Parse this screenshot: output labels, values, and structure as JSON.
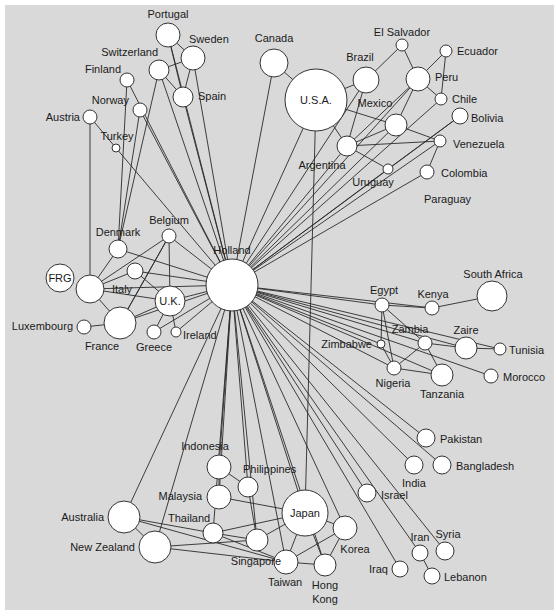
{
  "diagram": {
    "type": "network",
    "background": "#d9d9d9",
    "node_fill": "#ffffff",
    "edge_color": "#2a2a2a",
    "nodes": [
      {
        "id": "holland",
        "label": "Holland",
        "x": 232,
        "y": 285,
        "r": 26,
        "lx": 232,
        "ly": 254,
        "anchor": "middle"
      },
      {
        "id": "usa",
        "label": "U.S.A.",
        "x": 316,
        "y": 100,
        "r": 31,
        "lx": 316,
        "ly": 104,
        "anchor": "middle"
      },
      {
        "id": "canada",
        "label": "Canada",
        "x": 274,
        "y": 63,
        "r": 14,
        "lx": 274,
        "ly": 42,
        "anchor": "middle"
      },
      {
        "id": "brazil",
        "label": "Brazil",
        "x": 366,
        "y": 80,
        "r": 13,
        "lx": 360,
        "ly": 61,
        "anchor": "middle"
      },
      {
        "id": "elsalvador",
        "label": "El Salvador",
        "x": 402,
        "y": 45,
        "r": 6,
        "lx": 402,
        "ly": 36,
        "anchor": "middle"
      },
      {
        "id": "ecuador",
        "label": "Ecuador",
        "x": 446,
        "y": 51,
        "r": 6,
        "lx": 457,
        "ly": 55,
        "anchor": "start"
      },
      {
        "id": "peru",
        "label": "Peru",
        "x": 418,
        "y": 79,
        "r": 12,
        "lx": 435,
        "ly": 81,
        "anchor": "start"
      },
      {
        "id": "chile",
        "label": "Chile",
        "x": 441,
        "y": 99,
        "r": 6,
        "lx": 452,
        "ly": 103,
        "anchor": "start"
      },
      {
        "id": "mexico",
        "label": "Mexico",
        "x": 396,
        "y": 125,
        "r": 11,
        "lx": 375,
        "ly": 107,
        "anchor": "middle"
      },
      {
        "id": "bolivia",
        "label": "Bolivia",
        "x": 460,
        "y": 116,
        "r": 8,
        "lx": 471,
        "ly": 122,
        "anchor": "start"
      },
      {
        "id": "venezuela",
        "label": "Venezuela",
        "x": 440,
        "y": 141,
        "r": 6,
        "lx": 453,
        "ly": 148,
        "anchor": "start"
      },
      {
        "id": "argentina",
        "label": "Argentina",
        "x": 347,
        "y": 146,
        "r": 10,
        "lx": 322,
        "ly": 169,
        "anchor": "middle"
      },
      {
        "id": "uruguay",
        "label": "Uruguay",
        "x": 388,
        "y": 169,
        "r": 5,
        "lx": 373,
        "ly": 186,
        "anchor": "middle"
      },
      {
        "id": "colombia",
        "label": "Colombia",
        "x": 427,
        "y": 172,
        "r": 7,
        "lx": 441,
        "ly": 177,
        "anchor": "start"
      },
      {
        "id": "paraguay",
        "label": "Paraguay",
        "x": 0,
        "y": 0,
        "r": 0,
        "lx": 424,
        "ly": 203,
        "anchor": "start"
      },
      {
        "id": "portugal",
        "label": "Portugal",
        "x": 168,
        "y": 35,
        "r": 12,
        "lx": 168,
        "ly": 18,
        "anchor": "middle"
      },
      {
        "id": "sweden",
        "label": "Sweden",
        "x": 193,
        "y": 58,
        "r": 12,
        "lx": 189,
        "ly": 43,
        "anchor": "start"
      },
      {
        "id": "switzerland",
        "label": "Switzerland",
        "x": 159,
        "y": 70,
        "r": 10,
        "lx": 158,
        "ly": 56,
        "anchor": "end"
      },
      {
        "id": "spain",
        "label": "Spain",
        "x": 183,
        "y": 97,
        "r": 10,
        "lx": 198,
        "ly": 100,
        "anchor": "start"
      },
      {
        "id": "finland",
        "label": "Finland",
        "x": 127,
        "y": 80,
        "r": 7,
        "lx": 121,
        "ly": 73,
        "anchor": "end"
      },
      {
        "id": "norway",
        "label": "Norway",
        "x": 140,
        "y": 110,
        "r": 7,
        "lx": 129,
        "ly": 104,
        "anchor": "end"
      },
      {
        "id": "austria",
        "label": "Austria",
        "x": 90,
        "y": 117,
        "r": 7,
        "lx": 80,
        "ly": 121,
        "anchor": "end"
      },
      {
        "id": "turkey",
        "label": "Turkey",
        "x": 116,
        "y": 148,
        "r": 4,
        "lx": 117,
        "ly": 140,
        "anchor": "middle"
      },
      {
        "id": "belgium",
        "label": "Belgium",
        "x": 169,
        "y": 236,
        "r": 7,
        "lx": 169,
        "ly": 224,
        "anchor": "middle"
      },
      {
        "id": "denmark",
        "label": "Denmark",
        "x": 118,
        "y": 249,
        "r": 9,
        "lx": 118,
        "ly": 236,
        "anchor": "middle"
      },
      {
        "id": "frg",
        "label": "FRG",
        "x": 60,
        "y": 278,
        "r": 14,
        "lx": 60,
        "ly": 282,
        "anchor": "middle"
      },
      {
        "id": "germany",
        "label": "",
        "x": 90,
        "y": 289,
        "r": 14,
        "lx": 0,
        "ly": 0,
        "anchor": "middle"
      },
      {
        "id": "italy",
        "label": "Italy",
        "x": 135,
        "y": 271,
        "r": 8,
        "lx": 122,
        "ly": 293,
        "anchor": "middle"
      },
      {
        "id": "uk",
        "label": "U.K.",
        "x": 170,
        "y": 301,
        "r": 15,
        "lx": 170,
        "ly": 305,
        "anchor": "middle"
      },
      {
        "id": "france",
        "label": "France",
        "x": 120,
        "y": 323,
        "r": 16,
        "lx": 102,
        "ly": 350,
        "anchor": "middle"
      },
      {
        "id": "luxembourg",
        "label": "Luxembourg",
        "x": 84,
        "y": 327,
        "r": 7,
        "lx": 73,
        "ly": 330,
        "anchor": "end"
      },
      {
        "id": "greece",
        "label": "Greece",
        "x": 154,
        "y": 332,
        "r": 7,
        "lx": 154,
        "ly": 351,
        "anchor": "middle"
      },
      {
        "id": "ireland",
        "label": "Ireland",
        "x": 176,
        "y": 332,
        "r": 5,
        "lx": 183,
        "ly": 339,
        "anchor": "start"
      },
      {
        "id": "egypt",
        "label": "Egypt",
        "x": 382,
        "y": 305,
        "r": 7,
        "lx": 384,
        "ly": 294,
        "anchor": "middle"
      },
      {
        "id": "kenya",
        "label": "Kenya",
        "x": 432,
        "y": 308,
        "r": 7,
        "lx": 433,
        "ly": 298,
        "anchor": "middle"
      },
      {
        "id": "southafrica",
        "label": "South Africa",
        "x": 492,
        "y": 296,
        "r": 15,
        "lx": 493,
        "ly": 278,
        "anchor": "middle"
      },
      {
        "id": "zimbabwe",
        "label": "Zimbabwe",
        "x": 381,
        "y": 344,
        "r": 4,
        "lx": 372,
        "ly": 348,
        "anchor": "end"
      },
      {
        "id": "zambia",
        "label": "Zambia",
        "x": 425,
        "y": 343,
        "r": 7,
        "lx": 410,
        "ly": 333,
        "anchor": "middle"
      },
      {
        "id": "zaire",
        "label": "Zaire",
        "x": 466,
        "y": 348,
        "r": 11,
        "lx": 466,
        "ly": 334,
        "anchor": "middle"
      },
      {
        "id": "tunisia",
        "label": "Tunisia",
        "x": 500,
        "y": 349,
        "r": 6,
        "lx": 509,
        "ly": 354,
        "anchor": "start"
      },
      {
        "id": "nigeria",
        "label": "Nigeria",
        "x": 394,
        "y": 368,
        "r": 7,
        "lx": 393,
        "ly": 387,
        "anchor": "middle"
      },
      {
        "id": "tanzania",
        "label": "Tanzania",
        "x": 442,
        "y": 375,
        "r": 11,
        "lx": 442,
        "ly": 398,
        "anchor": "middle"
      },
      {
        "id": "morocco",
        "label": "Morocco",
        "x": 491,
        "y": 376,
        "r": 7,
        "lx": 503,
        "ly": 381,
        "anchor": "start"
      },
      {
        "id": "pakistan",
        "label": "Pakistan",
        "x": 426,
        "y": 438,
        "r": 9,
        "lx": 440,
        "ly": 443,
        "anchor": "start"
      },
      {
        "id": "india",
        "label": "India",
        "x": 414,
        "y": 465,
        "r": 9,
        "lx": 414,
        "ly": 487,
        "anchor": "middle"
      },
      {
        "id": "bangladesh",
        "label": "Bangladesh",
        "x": 442,
        "y": 465,
        "r": 9,
        "lx": 456,
        "ly": 470,
        "anchor": "start"
      },
      {
        "id": "israel",
        "label": "Israel",
        "x": 367,
        "y": 493,
        "r": 9,
        "lx": 381,
        "ly": 499,
        "anchor": "start"
      },
      {
        "id": "japan",
        "label": "Japan",
        "x": 305,
        "y": 513,
        "r": 23,
        "lx": 305,
        "ly": 517,
        "anchor": "middle"
      },
      {
        "id": "korea",
        "label": "Korea",
        "x": 345,
        "y": 528,
        "r": 12,
        "lx": 355,
        "ly": 553,
        "anchor": "middle"
      },
      {
        "id": "hongkong",
        "label": "Hong",
        "label2": "Kong",
        "x": 325,
        "y": 565,
        "r": 11,
        "lx": 325,
        "ly": 589,
        "anchor": "middle"
      },
      {
        "id": "taiwan",
        "label": "Taiwan",
        "x": 286,
        "y": 562,
        "r": 12,
        "lx": 285,
        "ly": 586,
        "anchor": "middle"
      },
      {
        "id": "iran",
        "label": "Iran",
        "x": 420,
        "y": 553,
        "r": 8,
        "lx": 420,
        "ly": 541,
        "anchor": "middle"
      },
      {
        "id": "syria",
        "label": "Syria",
        "x": 445,
        "y": 551,
        "r": 9,
        "lx": 448,
        "ly": 538,
        "anchor": "middle"
      },
      {
        "id": "iraq",
        "label": "Iraq",
        "x": 400,
        "y": 569,
        "r": 8,
        "lx": 388,
        "ly": 573,
        "anchor": "end"
      },
      {
        "id": "lebanon",
        "label": "Lebanon",
        "x": 432,
        "y": 576,
        "r": 8,
        "lx": 444,
        "ly": 581,
        "anchor": "start"
      },
      {
        "id": "indonesia",
        "label": "Indonesia",
        "x": 219,
        "y": 467,
        "r": 12,
        "lx": 205,
        "ly": 450,
        "anchor": "middle"
      },
      {
        "id": "philippines",
        "label": "Philippines",
        "x": 248,
        "y": 487,
        "r": 10,
        "lx": 243,
        "ly": 473,
        "anchor": "start"
      },
      {
        "id": "malaysia",
        "label": "Malaysia",
        "x": 219,
        "y": 497,
        "r": 12,
        "lx": 202,
        "ly": 500,
        "anchor": "end"
      },
      {
        "id": "thailand",
        "label": "Thailand",
        "x": 213,
        "y": 533,
        "r": 10,
        "lx": 168,
        "ly": 522,
        "anchor": "start"
      },
      {
        "id": "singapore",
        "label": "Singapore",
        "x": 257,
        "y": 540,
        "r": 11,
        "lx": 281,
        "ly": 565,
        "anchor": "end"
      },
      {
        "id": "australia",
        "label": "Australia",
        "x": 124,
        "y": 517,
        "r": 16,
        "lx": 104,
        "ly": 521,
        "anchor": "end"
      },
      {
        "id": "newzealand",
        "label": "New Zealand",
        "x": 155,
        "y": 547,
        "r": 16,
        "lx": 135,
        "ly": 551,
        "anchor": "end"
      }
    ],
    "edges": [
      [
        "holland",
        "usa"
      ],
      [
        "holland",
        "canada"
      ],
      [
        "holland",
        "brazil"
      ],
      [
        "holland",
        "argentina"
      ],
      [
        "holland",
        "mexico"
      ],
      [
        "holland",
        "peru"
      ],
      [
        "holland",
        "chile"
      ],
      [
        "holland",
        "bolivia"
      ],
      [
        "holland",
        "venezuela"
      ],
      [
        "holland",
        "uruguay"
      ],
      [
        "holland",
        "colombia"
      ],
      [
        "holland",
        "portugal"
      ],
      [
        "holland",
        "sweden"
      ],
      [
        "holland",
        "switzerland"
      ],
      [
        "holland",
        "spain"
      ],
      [
        "holland",
        "finland"
      ],
      [
        "holland",
        "norway"
      ],
      [
        "holland",
        "turkey"
      ],
      [
        "holland",
        "belgium"
      ],
      [
        "holland",
        "denmark"
      ],
      [
        "holland",
        "uk"
      ],
      [
        "holland",
        "france"
      ],
      [
        "holland",
        "germany"
      ],
      [
        "holland",
        "italy"
      ],
      [
        "holland",
        "greece"
      ],
      [
        "holland",
        "ireland"
      ],
      [
        "holland",
        "egypt"
      ],
      [
        "holland",
        "kenya"
      ],
      [
        "holland",
        "zambia"
      ],
      [
        "holland",
        "zaire"
      ],
      [
        "holland",
        "nigeria"
      ],
      [
        "holland",
        "tanzania"
      ],
      [
        "holland",
        "morocco"
      ],
      [
        "holland",
        "tunisia"
      ],
      [
        "holland",
        "zimbabwe"
      ],
      [
        "holland",
        "pakistan"
      ],
      [
        "holland",
        "india"
      ],
      [
        "holland",
        "bangladesh"
      ],
      [
        "holland",
        "israel"
      ],
      [
        "holland",
        "iran"
      ],
      [
        "holland",
        "iraq"
      ],
      [
        "holland",
        "syria"
      ],
      [
        "holland",
        "japan"
      ],
      [
        "holland",
        "korea"
      ],
      [
        "holland",
        "hongkong"
      ],
      [
        "holland",
        "taiwan"
      ],
      [
        "holland",
        "indonesia"
      ],
      [
        "holland",
        "philippines"
      ],
      [
        "holland",
        "malaysia"
      ],
      [
        "holland",
        "singapore"
      ],
      [
        "holland",
        "thailand"
      ],
      [
        "holland",
        "australia"
      ],
      [
        "holland",
        "newzealand"
      ],
      [
        "usa",
        "canada"
      ],
      [
        "usa",
        "brazil"
      ],
      [
        "usa",
        "mexico"
      ],
      [
        "usa",
        "argentina"
      ],
      [
        "usa",
        "japan"
      ],
      [
        "brazil",
        "argentina"
      ],
      [
        "brazil",
        "elsalvador"
      ],
      [
        "elsalvador",
        "peru"
      ],
      [
        "peru",
        "ecuador"
      ],
      [
        "peru",
        "chile"
      ],
      [
        "ecuador",
        "chile"
      ],
      [
        "peru",
        "mexico"
      ],
      [
        "mexico",
        "venezuela"
      ],
      [
        "argentina",
        "venezuela"
      ],
      [
        "argentina",
        "mexico"
      ],
      [
        "argentina",
        "uruguay"
      ],
      [
        "uruguay",
        "bolivia"
      ],
      [
        "venezuela",
        "colombia"
      ],
      [
        "argentina",
        "peru"
      ],
      [
        "portugal",
        "sweden"
      ],
      [
        "portugal",
        "spain"
      ],
      [
        "sweden",
        "spain"
      ],
      [
        "switzerland",
        "sweden"
      ],
      [
        "switzerland",
        "spain"
      ],
      [
        "finland",
        "denmark"
      ],
      [
        "norway",
        "denmark"
      ],
      [
        "austria",
        "turkey"
      ],
      [
        "austria",
        "germany"
      ],
      [
        "switzerland",
        "denmark"
      ],
      [
        "belgium",
        "germany"
      ],
      [
        "belgium",
        "france"
      ],
      [
        "belgium",
        "uk"
      ],
      [
        "denmark",
        "germany"
      ],
      [
        "germany",
        "italy"
      ],
      [
        "germany",
        "france"
      ],
      [
        "germany",
        "uk"
      ],
      [
        "italy",
        "uk"
      ],
      [
        "france",
        "uk"
      ],
      [
        "france",
        "luxembourg"
      ],
      [
        "uk",
        "greece"
      ],
      [
        "uk",
        "ireland"
      ],
      [
        "france",
        "belgium"
      ],
      [
        "egypt",
        "kenya"
      ],
      [
        "kenya",
        "southafrica"
      ],
      [
        "egypt",
        "zambia"
      ],
      [
        "egypt",
        "nigeria"
      ],
      [
        "egypt",
        "zimbabwe"
      ],
      [
        "zambia",
        "zaire"
      ],
      [
        "zaire",
        "tunisia"
      ],
      [
        "zambia",
        "tanzania"
      ],
      [
        "zambia",
        "nigeria"
      ],
      [
        "nigeria",
        "tanzania"
      ],
      [
        "zimbabwe",
        "nigeria"
      ],
      [
        "iran",
        "lebanon"
      ],
      [
        "indonesia",
        "malaysia"
      ],
      [
        "indonesia",
        "philippines"
      ],
      [
        "philippines",
        "singapore"
      ],
      [
        "malaysia",
        "japan"
      ],
      [
        "thailand",
        "singapore"
      ],
      [
        "thailand",
        "japan"
      ],
      [
        "australia",
        "newzealand"
      ],
      [
        "australia",
        "thailand"
      ],
      [
        "australia",
        "taiwan"
      ],
      [
        "newzealand",
        "singapore"
      ],
      [
        "newzealand",
        "taiwan"
      ],
      [
        "singapore",
        "japan"
      ],
      [
        "japan",
        "korea"
      ],
      [
        "japan",
        "taiwan"
      ],
      [
        "japan",
        "hongkong"
      ],
      [
        "korea",
        "taiwan"
      ],
      [
        "korea",
        "hongkong"
      ],
      [
        "taiwan",
        "hongkong"
      ],
      [
        "thailand",
        "taiwan"
      ]
    ]
  }
}
